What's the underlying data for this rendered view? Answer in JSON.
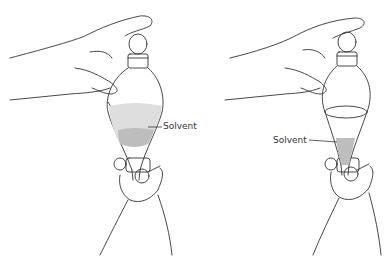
{
  "figure": {
    "panels": [
      {
        "id": "left",
        "description": "Separatory funnel held upside down with solvent layer in upper bulb",
        "label": "Solvent"
      },
      {
        "id": "right",
        "description": "Separatory funnel upright with solvent settled in the cone near the stopcock",
        "label": "Solvent"
      }
    ],
    "colors": {
      "line": "#333333",
      "solvent_fill": "#bdbdbd",
      "solvent_fill_light": "#dedede",
      "background": "#ffffff"
    }
  }
}
